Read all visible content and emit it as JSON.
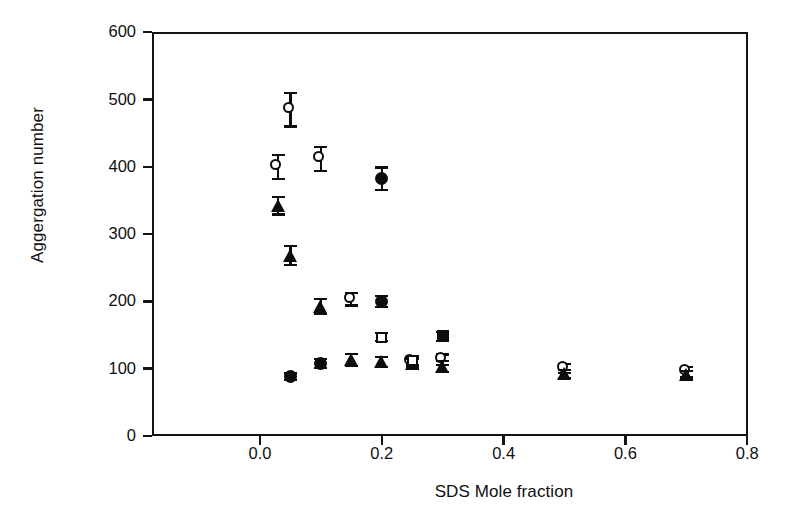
{
  "chart_data": {
    "type": "scatter",
    "title": "",
    "xlabel": "SDS Mole fraction",
    "ylabel": "Aggergation number",
    "xlim": [
      -0.1,
      0.8
    ],
    "ylim": [
      0,
      600
    ],
    "xticks": [
      "0.0",
      "0.2",
      "0.4",
      "0.6",
      "0.8"
    ],
    "xtick_values": [
      0.0,
      0.2,
      0.4,
      0.6,
      0.8
    ],
    "yticks": [
      "0",
      "100",
      "200",
      "300",
      "400",
      "500",
      "600"
    ],
    "ytick_values": [
      0,
      100,
      200,
      300,
      400,
      500,
      600
    ],
    "grid": false,
    "legend": "none",
    "error_bars": "vertical",
    "series": [
      {
        "name": "open-circle",
        "marker": "open-circle",
        "points": [
          {
            "x": 0.03,
            "y": 400,
            "err": 18
          },
          {
            "x": 0.05,
            "y": 485,
            "err": 25
          },
          {
            "x": 0.1,
            "y": 412,
            "err": 18
          },
          {
            "x": 0.15,
            "y": 203,
            "err": 9
          },
          {
            "x": 0.25,
            "y": 110,
            "err": 8
          },
          {
            "x": 0.3,
            "y": 113,
            "err": 8
          },
          {
            "x": 0.5,
            "y": 100,
            "err": 7
          },
          {
            "x": 0.7,
            "y": 95,
            "err": 7
          }
        ]
      },
      {
        "name": "filled-triangle",
        "marker": "filled-triangle",
        "points": [
          {
            "x": 0.03,
            "y": 342,
            "err": 13
          },
          {
            "x": 0.05,
            "y": 268,
            "err": 14
          },
          {
            "x": 0.1,
            "y": 192,
            "err": 11
          },
          {
            "x": 0.15,
            "y": 113,
            "err": 9
          },
          {
            "x": 0.2,
            "y": 110,
            "err": 8
          },
          {
            "x": 0.25,
            "y": 107,
            "err": 8
          },
          {
            "x": 0.3,
            "y": 103,
            "err": 8
          },
          {
            "x": 0.5,
            "y": 92,
            "err": 6
          },
          {
            "x": 0.7,
            "y": 90,
            "err": 6
          }
        ]
      },
      {
        "name": "filled-circle",
        "marker": "filled-circle",
        "points": [
          {
            "x": 0.05,
            "y": 88,
            "err": 5
          },
          {
            "x": 0.1,
            "y": 108,
            "err": 7
          },
          {
            "x": 0.2,
            "y": 382,
            "err": 17
          },
          {
            "x": 0.2,
            "y": 200,
            "err": 8
          }
        ]
      },
      {
        "name": "open-square",
        "marker": "open-square",
        "points": [
          {
            "x": 0.2,
            "y": 147,
            "err": 6
          },
          {
            "x": 0.25,
            "y": 112,
            "err": 6
          }
        ]
      },
      {
        "name": "filled-square",
        "marker": "filled-square",
        "points": [
          {
            "x": 0.3,
            "y": 148,
            "err": 7
          }
        ]
      }
    ]
  },
  "figure": {
    "xlabel": "SDS Mole fraction",
    "ylabel": "Aggergation number"
  },
  "colors": {
    "ink": "#0d0d0d",
    "background": "#ffffff"
  }
}
